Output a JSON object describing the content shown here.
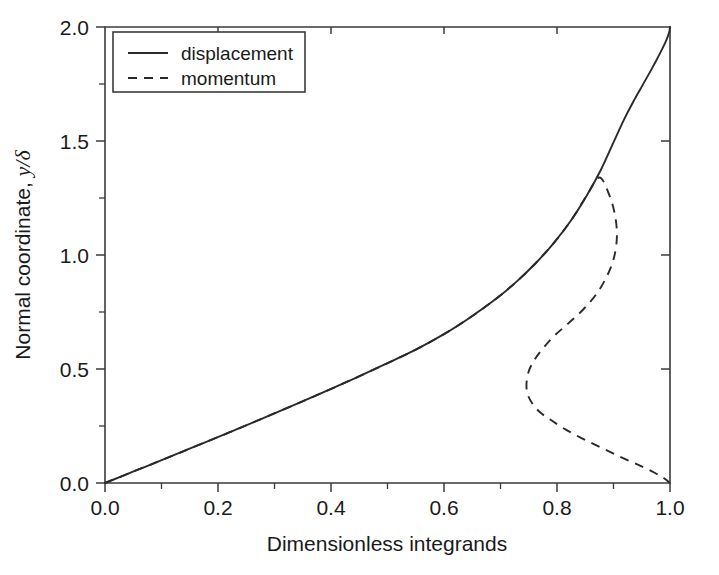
{
  "chart_data": {
    "type": "line",
    "title": "",
    "subtitle": "",
    "xlabel": "Dimensionless integrands",
    "ylabel": "Normal coordinate, y/δ",
    "ylabel_prefix": "Normal coordinate, ",
    "ylabel_symbol": "y/δ",
    "xlim": [
      0.0,
      1.0
    ],
    "ylim": [
      0.0,
      2.0
    ],
    "grid": false,
    "legend_position": "upper-left-inside",
    "xticks": [
      "0.0",
      "0.2",
      "0.4",
      "0.6",
      "0.8",
      "1.0"
    ],
    "xtick_values": [
      0.0,
      0.2,
      0.4,
      0.6,
      0.8,
      1.0
    ],
    "xminor_values": [
      0.1,
      0.3,
      0.5,
      0.7,
      0.9
    ],
    "yticks": [
      "0.0",
      "0.5",
      "1.0",
      "1.5",
      "2.0"
    ],
    "ytick_values": [
      0.0,
      0.5,
      1.0,
      1.5,
      2.0
    ],
    "yminor_values": [
      0.25,
      0.75,
      1.25,
      1.75
    ],
    "axis_color": "#3b3b3b",
    "curve_color": "#2a2a2a",
    "series": [
      {
        "name": "displacement",
        "style": "solid",
        "x": [
          0.0,
          0.055,
          0.11,
          0.165,
          0.22,
          0.275,
          0.33,
          0.385,
          0.44,
          0.495,
          0.55,
          0.6,
          0.645,
          0.688,
          0.727,
          0.763,
          0.796,
          0.826,
          0.853,
          0.878,
          0.9,
          0.919,
          0.936,
          0.951,
          0.964,
          0.975,
          0.984,
          0.991,
          0.996,
          0.999,
          1.0
        ],
        "y": [
          0.0,
          0.055,
          0.11,
          0.166,
          0.222,
          0.279,
          0.337,
          0.396,
          0.457,
          0.52,
          0.585,
          0.653,
          0.724,
          0.8,
          0.88,
          0.966,
          1.058,
          1.156,
          1.262,
          1.375,
          1.494,
          1.596,
          1.677,
          1.743,
          1.8,
          1.85,
          1.893,
          1.928,
          1.958,
          1.982,
          2.0
        ]
      },
      {
        "name": "momentum",
        "style": "dashed",
        "x": [
          0.0,
          0.055,
          0.11,
          0.165,
          0.22,
          0.275,
          0.33,
          0.385,
          0.44,
          0.495,
          0.55,
          0.6,
          0.645,
          0.688,
          0.727,
          0.763,
          0.796,
          0.826,
          0.853,
          0.875,
          0.893,
          0.903,
          0.906,
          0.901,
          0.889,
          0.87,
          0.846,
          0.82,
          0.795,
          0.775,
          0.76,
          0.75,
          0.746,
          0.748,
          0.756,
          0.77,
          0.79,
          0.815,
          0.845,
          0.878,
          0.912,
          0.945,
          0.972,
          0.99,
          1.0
        ],
        "y": [
          0.0,
          0.055,
          0.11,
          0.166,
          0.222,
          0.279,
          0.337,
          0.396,
          0.457,
          0.52,
          0.585,
          0.653,
          0.724,
          0.8,
          0.88,
          0.966,
          1.058,
          1.156,
          1.262,
          1.34,
          1.26,
          1.17,
          1.08,
          0.99,
          0.91,
          0.83,
          0.76,
          0.7,
          0.645,
          0.59,
          0.54,
          0.49,
          0.435,
          0.39,
          0.35,
          0.31,
          0.275,
          0.235,
          0.195,
          0.155,
          0.115,
          0.078,
          0.046,
          0.02,
          0.0
        ],
        "annotation": "leftmost x approx 0.746 at y approx 0.435"
      }
    ]
  },
  "legend": {
    "entries": [
      {
        "label": "displacement",
        "style": "solid"
      },
      {
        "label": "momentum",
        "style": "dashed"
      }
    ]
  }
}
